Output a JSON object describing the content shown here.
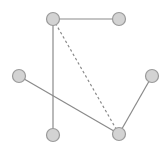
{
  "diagram": {
    "type": "graph",
    "colors": {
      "background": "#ffffff",
      "node_fill": "#d3d3d3",
      "node_stroke": "#9a9a9a",
      "edge": "#8a8a8a"
    },
    "node_radius": 6.5,
    "nodes": [
      {
        "id": "A",
        "x": 53,
        "y": 19
      },
      {
        "id": "B",
        "x": 119,
        "y": 19
      },
      {
        "id": "C",
        "x": 19,
        "y": 76
      },
      {
        "id": "D",
        "x": 152,
        "y": 76
      },
      {
        "id": "E",
        "x": 53,
        "y": 135
      },
      {
        "id": "F",
        "x": 119,
        "y": 134
      }
    ],
    "edges": [
      {
        "from": "A",
        "to": "B",
        "style": "solid"
      },
      {
        "from": "A",
        "to": "E",
        "style": "solid"
      },
      {
        "from": "A",
        "to": "F",
        "style": "dashed"
      },
      {
        "from": "C",
        "to": "F",
        "style": "solid"
      },
      {
        "from": "D",
        "to": "F",
        "style": "solid"
      }
    ]
  }
}
